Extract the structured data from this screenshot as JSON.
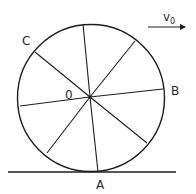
{
  "diagram": {
    "type": "rolling-wheel",
    "stroke_color": "#1e1e1e",
    "background": "#ffffff",
    "wheel": {
      "center": [
        91,
        97
      ],
      "radius": 74,
      "spoke_count": 8,
      "spokes": [
        [
          83,
          24
        ],
        [
          135,
          41
        ],
        [
          163,
          89
        ],
        [
          147,
          143
        ],
        [
          98,
          172
        ],
        [
          47,
          153
        ],
        [
          20,
          106
        ],
        [
          35,
          52
        ]
      ]
    },
    "ground": {
      "y": 172,
      "x1": 8,
      "x2": 176
    },
    "velocity": {
      "label": "v",
      "subscript": "0",
      "arrow_from": [
        148,
        27
      ],
      "arrow_to": [
        186,
        27
      ]
    },
    "labels": {
      "center": "0",
      "A": "A",
      "B": "B",
      "C": "C"
    }
  }
}
